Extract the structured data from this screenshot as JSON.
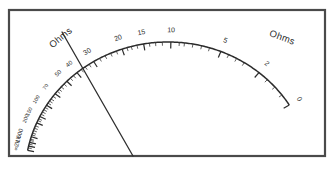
{
  "meter": {
    "title": "Ohms",
    "scale_left_label": "Ohms",
    "scale_right_label": "Ohms",
    "unit": "Ohms",
    "scale_type": "ohms",
    "scale_direction": "reversed",
    "colors": {
      "frame": "#4a4a4a",
      "arc": "#2b2b2b",
      "tick": "#2b2b2b",
      "needle": "#2f2f2f",
      "background": "#ffffff",
      "text": "#2b2b2b"
    },
    "needle": {
      "name": "pointer-needle",
      "x1": 62,
      "y1": 32,
      "x2": 133,
      "y2": 156
    },
    "frame_rect": {
      "x": 9,
      "y": 10,
      "width": 316,
      "height": 146
    },
    "arc": {
      "cx": 168,
      "cy": 176,
      "rx": 143,
      "ry": 134,
      "start_angle_deg": 191,
      "end_angle_deg": 328
    }
  },
  "chart_data": {
    "type": "scatter",
    "title": "Ohms",
    "xlabel": "",
    "ylabel": "",
    "labels": [
      {
        "text": "0",
        "value": 0,
        "pos": 1.0,
        "size": "num"
      },
      {
        "text": "2",
        "value": 2,
        "pos": 0.865,
        "size": "num"
      },
      {
        "text": "5",
        "value": 5,
        "pos": 0.735,
        "size": "num"
      },
      {
        "text": "10",
        "value": 10,
        "pos": 0.585,
        "size": "num"
      },
      {
        "text": "15",
        "value": 15,
        "pos": 0.505,
        "size": "num"
      },
      {
        "text": "20",
        "value": 20,
        "pos": 0.44,
        "size": "num"
      },
      {
        "text": "30",
        "value": 30,
        "pos": 0.348,
        "size": "num"
      },
      {
        "text": "40",
        "value": 40,
        "pos": 0.288,
        "size": "num-sm"
      },
      {
        "text": "50",
        "value": 50,
        "pos": 0.248,
        "size": "num-sm"
      },
      {
        "text": "70",
        "value": 70,
        "pos": 0.196,
        "size": "num-xs"
      },
      {
        "text": "100",
        "value": 100,
        "pos": 0.152,
        "size": "num-xs"
      },
      {
        "text": "150",
        "value": 150,
        "pos": 0.112,
        "size": "num-xs"
      },
      {
        "text": "200",
        "value": 200,
        "pos": 0.09,
        "size": "num-xs"
      },
      {
        "text": "500",
        "value": 500,
        "pos": 0.044,
        "size": "num-sm"
      },
      {
        "text": "1k",
        "value": 1000,
        "pos": 0.026,
        "size": "num-sm"
      },
      {
        "text": "2k",
        "value": 2000,
        "pos": 0.014,
        "size": "num-sm"
      },
      {
        "text": "∞",
        "value": null,
        "pos": 0.0,
        "size": "num-sm"
      }
    ],
    "major_ticks": [
      1.0,
      0.865,
      0.735,
      0.585,
      0.505,
      0.44,
      0.348,
      0.288,
      0.248,
      0.196,
      0.152,
      0.112,
      0.09,
      0.044,
      0.026,
      0.014,
      0.0
    ],
    "minor_ticks": [
      0.962,
      0.93,
      0.898,
      0.812,
      0.786,
      0.76,
      0.7,
      0.676,
      0.65,
      0.625,
      0.61,
      0.56,
      0.54,
      0.522,
      0.485,
      0.468,
      0.455,
      0.422,
      0.404,
      0.386,
      0.368,
      0.332,
      0.318,
      0.304,
      0.274,
      0.262,
      0.236,
      0.224,
      0.214,
      0.206,
      0.186,
      0.176,
      0.168,
      0.16,
      0.144,
      0.136,
      0.128,
      0.12,
      0.104,
      0.098,
      0.08,
      0.072,
      0.064,
      0.056,
      0.05,
      0.036,
      0.032,
      0.02,
      0.008
    ],
    "legend_position": "none",
    "grid": false
  }
}
